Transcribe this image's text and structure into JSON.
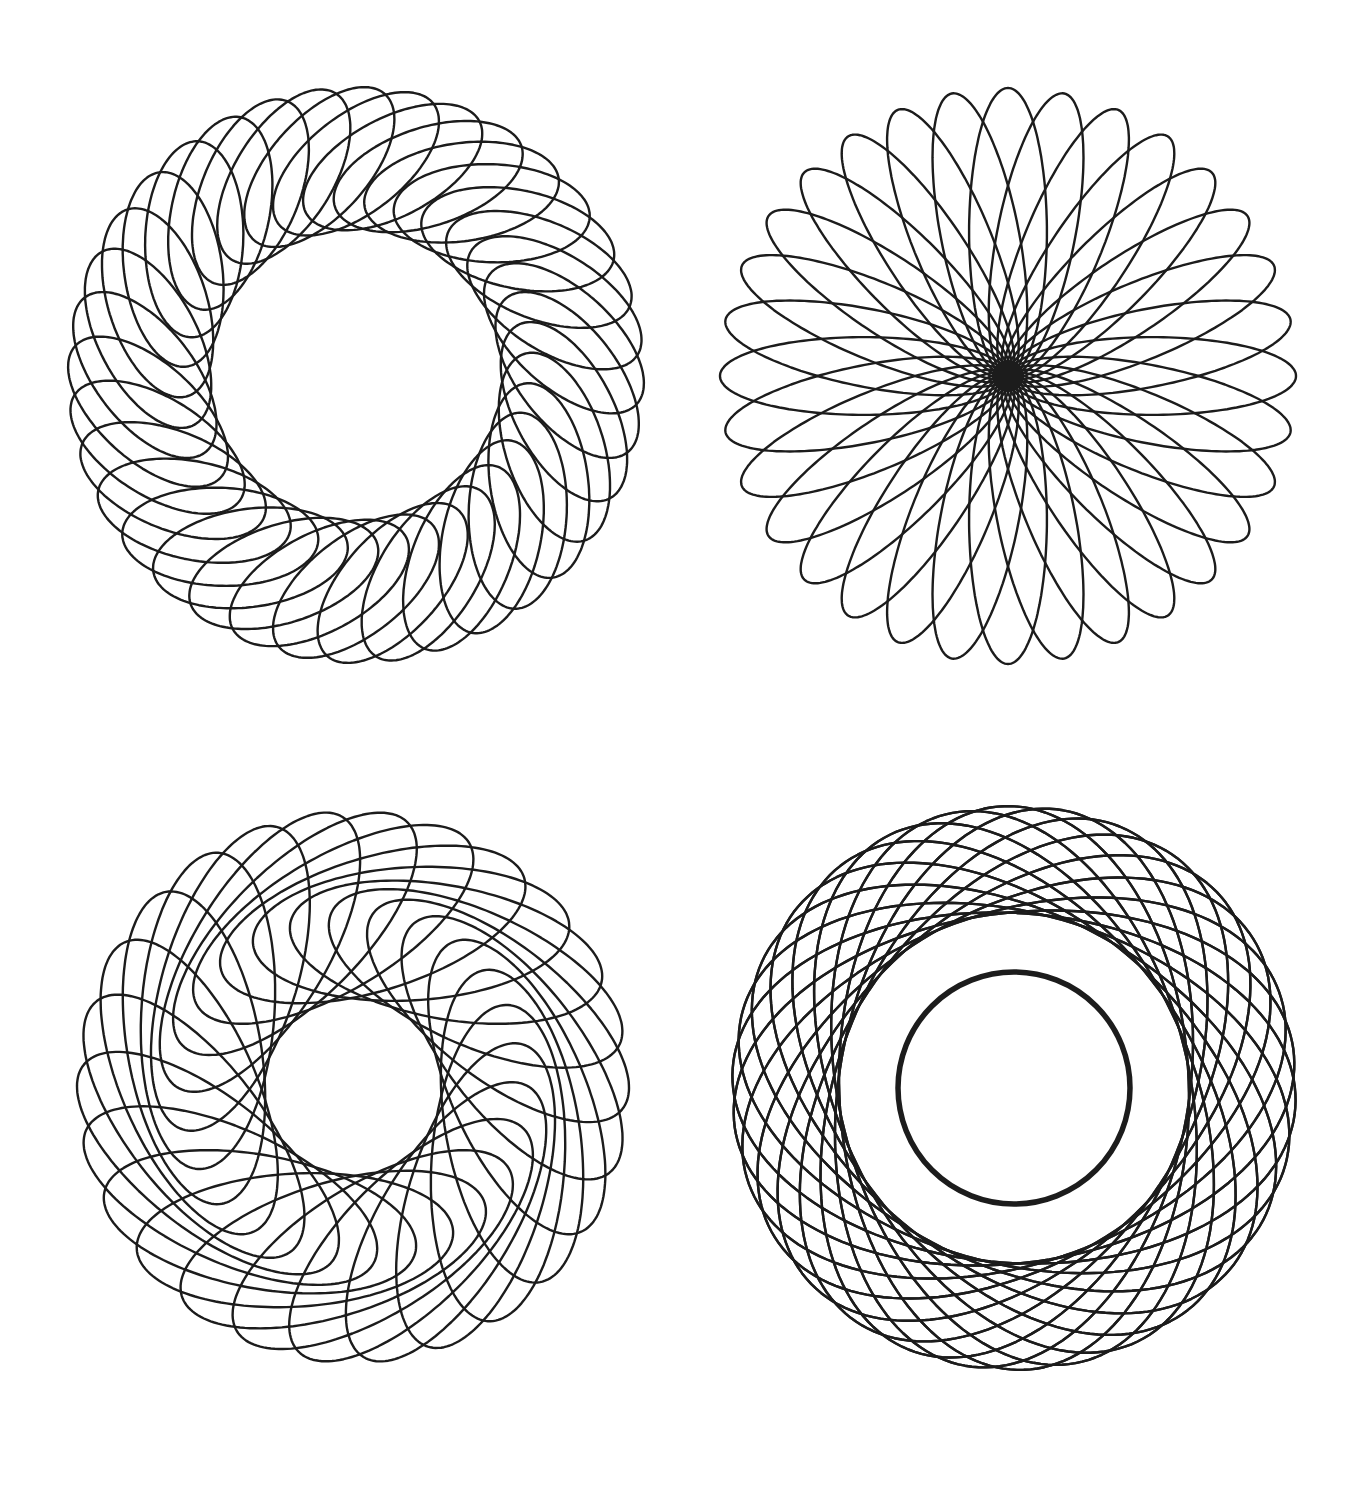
{
  "page": {
    "width": 1360,
    "height": 1501,
    "background": "#ffffff",
    "stroke_color": "#1c1c1c",
    "stroke_width": 2.4
  },
  "figures": [
    {
      "id": "top-left",
      "description": "annular lattice spirograph with large empty center",
      "center": [
        356,
        375
      ],
      "inner_radius": 145,
      "outer_radius": 288,
      "count": 36,
      "ellipse_ratio": 0.5,
      "tilt_deg": 52,
      "extra_rings": []
    },
    {
      "id": "top-right",
      "description": "rose spirograph with all loops passing through dense center",
      "center": [
        1008,
        376
      ],
      "inner_radius": 0,
      "outer_radius": 288,
      "count": 32,
      "ellipse_ratio": 0.27,
      "tilt_deg": 0,
      "extra_rings": []
    },
    {
      "id": "bottom-left",
      "description": "swirling twisted spirograph with medium empty center",
      "center": [
        353,
        1087
      ],
      "inner_radius": 88,
      "outer_radius": 276,
      "count": 26,
      "ellipse_ratio": 0.42,
      "tilt_deg": 66,
      "extra_rings": []
    },
    {
      "id": "bottom-right",
      "description": "spirograph with dense inner ring and small empty center",
      "center": [
        1014,
        1088
      ],
      "inner_radius": 29,
      "outer_radius": 282,
      "count": 30,
      "ellipse_ratio": 0.62,
      "tilt_deg": 28,
      "extra_rings": [
        {
          "radius": 116,
          "width": 5.5
        }
      ]
    }
  ]
}
